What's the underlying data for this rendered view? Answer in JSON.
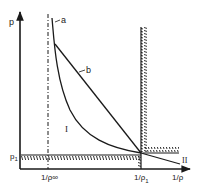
{
  "diagram": {
    "y_axis_label": "p",
    "x_axis_label": "1/ρ",
    "p1_label": "p",
    "p1_subscript": "1",
    "x_tick_inf": "1/ρ∞",
    "x_tick_rho1_main": "1/ρ",
    "x_tick_rho1_sub": "1",
    "curve_a_label": "a",
    "curve_b_label": "b",
    "region_I_label": "I",
    "region_II_label": "II",
    "colors": {
      "ink": "#1a1a1a",
      "background": "#ffffff"
    }
  }
}
